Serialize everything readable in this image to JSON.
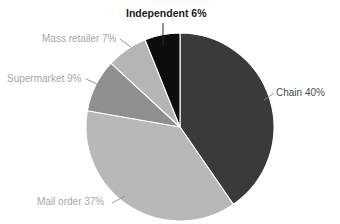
{
  "chart": {
    "title": "",
    "background_color": "#ffffff"
  },
  "labels": {
    "independent": "Independent 6%",
    "chain": "Chain 40%",
    "mass_retailer": "Mass retailer 7%",
    "supermarket": "Supermarket 9%",
    "mail_order": "Mail order 37%"
  },
  "chart_data": {
    "type": "pie",
    "title": "",
    "xlabel": "",
    "ylabel": "",
    "legend_position": "none",
    "grid": false,
    "start_angle_deg": 0,
    "direction": "clockwise",
    "categories": [
      "Chain",
      "Mail order",
      "Supermarket",
      "Mass retailer",
      "Independent"
    ],
    "values": [
      40,
      37,
      9,
      7,
      6
    ],
    "unit": "%",
    "total": 99,
    "data_labels": [
      "Chain 40%",
      "Mail order 37%",
      "Supermarket 9%",
      "Mass retailer 7%",
      "Independent 6%"
    ],
    "colors": [
      "#3a3a3a",
      "#b8b8b8",
      "#8f8f8f",
      "#b5b5b5",
      "#0d0d0d"
    ],
    "slices": [
      {
        "name": "Chain",
        "value": 40,
        "label": "Chain 40%",
        "color": "#3a3a3a",
        "label_color": "#4a4a4a"
      },
      {
        "name": "Mail order",
        "value": 37,
        "label": "Mail order 37%",
        "color": "#b8b8b8",
        "label_color": "#a6a6a6"
      },
      {
        "name": "Supermarket",
        "value": 9,
        "label": "Supermarket 9%",
        "color": "#8f8f8f",
        "label_color": "#a6a6a6"
      },
      {
        "name": "Mass retailer",
        "value": 7,
        "label": "Mass retailer 7%",
        "color": "#b5b5b5",
        "label_color": "#a6a6a6"
      },
      {
        "name": "Independent",
        "value": 6,
        "label": "Independent 6%",
        "color": "#0d0d0d",
        "label_color": "#1c1c1c"
      }
    ]
  }
}
